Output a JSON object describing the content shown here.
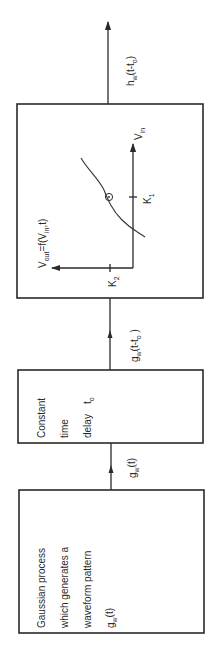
{
  "diagram": {
    "orientation": "rotated-counterclockwise",
    "blocks": [
      {
        "id": "gaussian-process",
        "lines": [
          "Gaussian process",
          "which generates a",
          "waveform pattern"
        ],
        "signal": {
          "base": "g",
          "sub": "w",
          "arg": "(t)"
        }
      },
      {
        "id": "time-delay",
        "lines": [
          "Constant",
          "time",
          "delay"
        ],
        "delay_symbol": {
          "base": "t",
          "sub": "o"
        }
      },
      {
        "id": "nonlinear-function",
        "function_label": {
          "lhs_base": "V",
          "lhs_sub": "out",
          "eq": "=f(",
          "arg_base": "V",
          "arg_sub": "in",
          "tail": ",t)"
        },
        "input_axis_label": {
          "base": "V",
          "sub": "in"
        },
        "ticks": [
          {
            "base": "K",
            "sub": "1"
          },
          {
            "base": "K",
            "sub": "2"
          }
        ]
      }
    ],
    "edges": [
      {
        "from": "gaussian-process",
        "to": "time-delay",
        "label": {
          "base": "g",
          "sub": "w",
          "arg": "(t)"
        }
      },
      {
        "from": "time-delay",
        "to": "nonlinear-function",
        "label": {
          "base": "g",
          "sub": "w",
          "arg_open": "(t-t",
          "arg_sub": "o",
          "arg_close": " )"
        }
      },
      {
        "from": "nonlinear-function",
        "to": "output",
        "label": {
          "base": "h",
          "sub": "w",
          "arg_open": "(t-t",
          "arg_sub": "o",
          "arg_close": ")"
        }
      }
    ]
  }
}
